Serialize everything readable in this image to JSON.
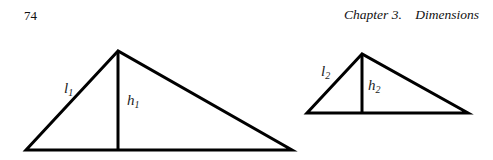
{
  "header": {
    "page_number": "74",
    "running_head": "Chapter 3.    Dimensions"
  },
  "figure": {
    "triangles": [
      {
        "name": "triangle-1",
        "apex": [
          118,
          51
        ],
        "base_left": [
          26,
          150
        ],
        "base_right": [
          292,
          150
        ],
        "side_label": "l",
        "side_sub": "1",
        "height_label": "h",
        "height_sub": "1"
      },
      {
        "name": "triangle-2",
        "apex": [
          362,
          54
        ],
        "base_left": [
          307,
          113
        ],
        "base_right": [
          468,
          113
        ],
        "side_label": "l",
        "side_sub": "2",
        "height_label": "h",
        "height_sub": "2"
      }
    ],
    "stroke_color": "#000000"
  }
}
